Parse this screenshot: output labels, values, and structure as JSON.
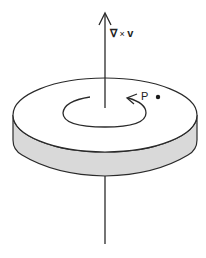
{
  "figure": {
    "type": "curl-of-velocity-field-illustration",
    "axis_label": {
      "nabla": "∇",
      "operator": "×",
      "vector": "v",
      "full": "∇ × v"
    },
    "point_label": "P",
    "colors": {
      "line": "#2a2a2a",
      "disk_top": "#ffffff",
      "disk_side": "#d9d9d9",
      "background": "#ffffff"
    },
    "elements": [
      "vertical axis arrow pointing up",
      "flat disk (cylinder) pierced by axis",
      "circular rotation arrow on disk top (counter-clockwise)",
      "point P with dot on disk surface"
    ]
  }
}
